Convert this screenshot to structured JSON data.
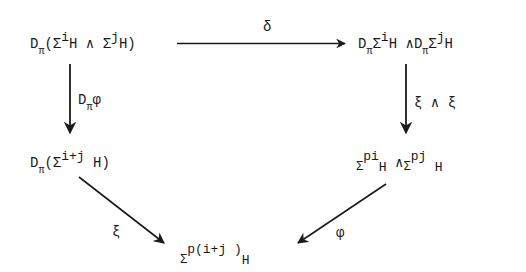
{
  "diagram": {
    "type": "commutative-diagram",
    "nodes": {
      "top_left": {
        "D": "D",
        "pi": "π",
        "open": "(",
        "sigma1": "Σ",
        "i": "i",
        "H1": "H",
        "wedge": "∧",
        "sigma2": "Σ",
        "j": "j",
        "H2": "H",
        "close": ")",
        "full_text": "D_π(Σ^i H ∧ Σ^j H)"
      },
      "top_right": {
        "D1": "D",
        "pi1": "π",
        "sigma1": "Σ",
        "i": "i",
        "H1": "H",
        "wedge": "∧",
        "D2": "D",
        "pi2": "π",
        "sigma2": "Σ",
        "j": "j",
        "H2": "H",
        "full_text": "D_π Σ^i H ∧ D_π Σ^j H"
      },
      "mid_left": {
        "D": "D",
        "pi": "π",
        "open": "(",
        "sigma": "Σ",
        "exp": "i+j",
        "H": "H",
        "close": ")",
        "full_text": "D_π(Σ^{i+j} H)"
      },
      "mid_right": {
        "sigma1": "Σ",
        "exp1": "pi",
        "H1": "H",
        "wedge": "∧",
        "sigma2": "Σ",
        "exp2": "pj",
        "H2": "H",
        "full_text": "Σ^{pi} H ∧ Σ^{pj} H"
      },
      "bottom": {
        "sigma": "Σ",
        "exp": "p(i+j )",
        "H": "H",
        "full_text": "Σ^{p(i+j)} H"
      }
    },
    "arrows": {
      "top": {
        "label": "δ",
        "from": "top_left",
        "to": "top_right"
      },
      "left": {
        "label_D": "D",
        "label_pi": "π",
        "label_phi": "φ",
        "full_label": "D_π φ",
        "from": "top_left",
        "to": "mid_left"
      },
      "right": {
        "label": "ξ ∧ ξ",
        "from": "top_right",
        "to": "mid_right"
      },
      "diag_left": {
        "label": "ξ",
        "from": "mid_left",
        "to": "bottom"
      },
      "diag_right": {
        "label": "φ",
        "from": "mid_right",
        "to": "bottom"
      }
    },
    "colors": {
      "ink": "#1a1a1a",
      "background": "#ffffff"
    }
  }
}
